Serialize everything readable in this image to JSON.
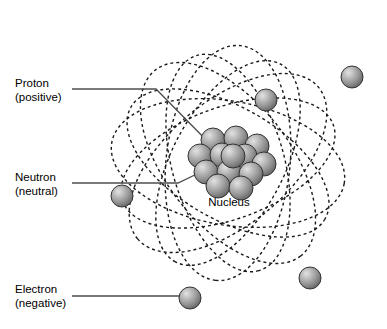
{
  "figure": {
    "background_color": "#ffffff"
  },
  "labels": {
    "proton": {
      "name": "Proton",
      "qualifier": "(positive)"
    },
    "neutron": {
      "name": "Neutron",
      "qualifier": "(neutral)"
    },
    "electron": {
      "name": "Electron",
      "qualifier": "(negative)"
    },
    "nucleus": {
      "name": "Nucleus"
    }
  },
  "colors": {
    "stroke": "#1a1a1a",
    "leader_line": "#4d4d4d",
    "sphere_light": "#d8d8d8",
    "sphere_mid": "#9a9a9a",
    "sphere_dark": "#6e6e6e",
    "sphere_outline": "#333333",
    "text": "#000000"
  },
  "geometry": {
    "nucleus_center": {
      "x": 228,
      "y": 163
    },
    "nucleus_particle_radius": 12,
    "electron_radius": 11,
    "orbit_dash": "3 3",
    "orbit_stroke_width": 1.4,
    "nucleus_particles": [
      {
        "x": 213,
        "y": 140
      },
      {
        "x": 236,
        "y": 138
      },
      {
        "x": 257,
        "y": 146
      },
      {
        "x": 200,
        "y": 156
      },
      {
        "x": 222,
        "y": 155
      },
      {
        "x": 245,
        "y": 156
      },
      {
        "x": 264,
        "y": 164
      },
      {
        "x": 206,
        "y": 172
      },
      {
        "x": 229,
        "y": 172
      },
      {
        "x": 251,
        "y": 174
      },
      {
        "x": 218,
        "y": 186
      },
      {
        "x": 241,
        "y": 188
      },
      {
        "x": 233,
        "y": 156
      }
    ],
    "electrons": [
      {
        "x": 352,
        "y": 77
      },
      {
        "x": 266,
        "y": 100
      },
      {
        "x": 122,
        "y": 196
      },
      {
        "x": 310,
        "y": 278
      },
      {
        "x": 190,
        "y": 298
      }
    ],
    "orbits": [
      {
        "cx": 228,
        "cy": 163,
        "rx": 118,
        "ry": 62,
        "rotate": 10
      },
      {
        "cx": 228,
        "cy": 163,
        "rx": 118,
        "ry": 62,
        "rotate": 52
      },
      {
        "cx": 228,
        "cy": 163,
        "rx": 118,
        "ry": 62,
        "rotate": 96
      },
      {
        "cx": 228,
        "cy": 163,
        "rx": 118,
        "ry": 62,
        "rotate": 140
      },
      {
        "cx": 228,
        "cy": 163,
        "rx": 112,
        "ry": 56,
        "rotate": 30
      },
      {
        "cx": 228,
        "cy": 163,
        "rx": 112,
        "ry": 56,
        "rotate": 74
      },
      {
        "cx": 228,
        "cy": 163,
        "rx": 112,
        "ry": 56,
        "rotate": 118
      },
      {
        "cx": 228,
        "cy": 163,
        "rx": 112,
        "ry": 56,
        "rotate": 160
      }
    ],
    "leaders": {
      "proton": "M 72 89 L 156 89 L 216 150",
      "neutron": "M 72 183 L 178 183 L 203 171",
      "electron": "M 72 296 L 182 296"
    }
  }
}
